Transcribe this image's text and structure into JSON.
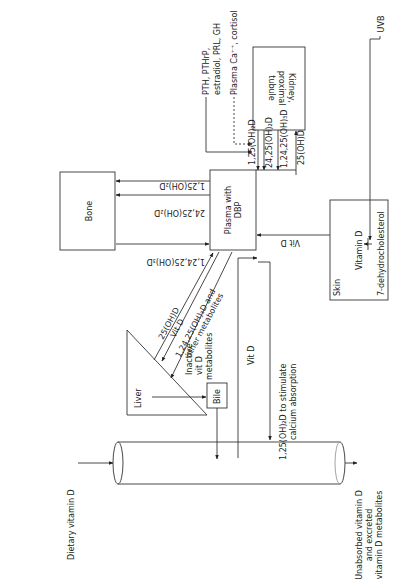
{
  "diagram": {
    "nodes": {
      "kidney": [
        "Kidney,",
        "proximal",
        "tubule"
      ],
      "bone": "Bone",
      "plasma": [
        "Plasma with",
        "DBP"
      ],
      "skin": {
        "label": "Skin",
        "vitd": "Vitamin D",
        "precursor": "7-dehydrocholesterol"
      },
      "liver": "Liver",
      "bile": "Bile"
    },
    "regulators": {
      "line1": "PTH, PTHrP,",
      "line2": "estradiol, PRL, GH",
      "line3": "Plasma Ca⁺⁺, cortisol"
    },
    "kidney_plasma_arrows": [
      "1,25(OH)₂D",
      "24,25(OH)₂D",
      "1,24,25(OH)₃D",
      "25(OH)D"
    ],
    "plasma_bone_arrows": [
      "1,25(OH)₂D",
      "24,25(OH)₂D",
      "1,24,25(OH)₃D"
    ],
    "liver_plasma_arrows": [
      "25(OH)D",
      "Vit D",
      "1,24,25(OH)₃D and",
      "other metabolites"
    ],
    "inactive": [
      "Inactive",
      "vit D",
      "metabolites"
    ],
    "uvb": "UVB",
    "skin_vitd_arrow": "Vit D",
    "intestine_vitd": "Vit D",
    "calcium": [
      "1,25(OH)₂D to stimulate",
      "calcium absorption"
    ],
    "dietary": "Dietary vitamin D",
    "excreted": [
      "Unabsorbed vitamin D",
      "and excreted",
      "vitamin D metabolites"
    ]
  }
}
